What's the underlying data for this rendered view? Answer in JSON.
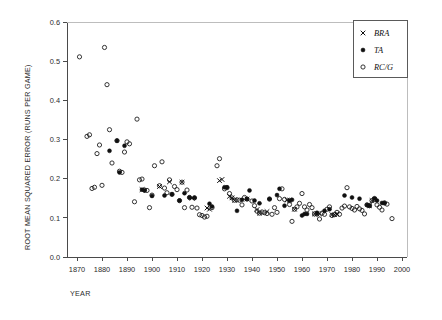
{
  "chart_data": {
    "type": "scatter",
    "title": "",
    "xlabel": "YEAR",
    "ylabel": "ROOT MEAN SQUARED ERROR (RUNS PER GAME)",
    "xlim": [
      1866,
      2002
    ],
    "ylim": [
      0.0,
      0.6
    ],
    "xticks": [
      1870,
      1880,
      1890,
      1900,
      1910,
      1920,
      1930,
      1940,
      1950,
      1960,
      1970,
      1980,
      1990,
      2000
    ],
    "yticks": [
      "0.0",
      "0.1",
      "0.2",
      "0.3",
      "0.4",
      "0.5",
      "0.6"
    ],
    "ytick_values": [
      0.0,
      0.1,
      0.2,
      0.3,
      0.4,
      0.5,
      0.6
    ],
    "grid": false,
    "legend_position": "top-right",
    "legend": [
      {
        "name": "BRA",
        "marker": "cross"
      },
      {
        "name": "TA",
        "marker": "filled-circle"
      },
      {
        "name": "RC/G",
        "marker": "open-circle"
      }
    ],
    "series": [
      {
        "name": "RC/G",
        "marker": "open-circle",
        "points": [
          [
            1871,
            0.511
          ],
          [
            1874,
            0.308
          ],
          [
            1875,
            0.312
          ],
          [
            1876,
            0.175
          ],
          [
            1877,
            0.178
          ],
          [
            1878,
            0.264
          ],
          [
            1879,
            0.286
          ],
          [
            1880,
            0.183
          ],
          [
            1881,
            0.535
          ],
          [
            1882,
            0.44
          ],
          [
            1883,
            0.325
          ],
          [
            1884,
            0.24
          ],
          [
            1886,
            0.297
          ],
          [
            1887,
            0.219
          ],
          [
            1888,
            0.216
          ],
          [
            1889,
            0.268
          ],
          [
            1890,
            0.294
          ],
          [
            1891,
            0.289
          ],
          [
            1893,
            0.141
          ],
          [
            1894,
            0.352
          ],
          [
            1895,
            0.197
          ],
          [
            1896,
            0.199
          ],
          [
            1897,
            0.171
          ],
          [
            1898,
            0.17
          ],
          [
            1899,
            0.126
          ],
          [
            1900,
            0.158
          ],
          [
            1901,
            0.233
          ],
          [
            1903,
            0.182
          ],
          [
            1904,
            0.243
          ],
          [
            1905,
            0.176
          ],
          [
            1906,
            0.164
          ],
          [
            1907,
            0.197
          ],
          [
            1908,
            0.16
          ],
          [
            1909,
            0.18
          ],
          [
            1910,
            0.172
          ],
          [
            1911,
            0.144
          ],
          [
            1912,
            0.191
          ],
          [
            1913,
            0.126
          ],
          [
            1914,
            0.171
          ],
          [
            1915,
            0.152
          ],
          [
            1916,
            0.127
          ],
          [
            1917,
            0.151
          ],
          [
            1918,
            0.125
          ],
          [
            1919,
            0.108
          ],
          [
            1920,
            0.106
          ],
          [
            1921,
            0.102
          ],
          [
            1922,
            0.104
          ],
          [
            1924,
            0.126
          ],
          [
            1926,
            0.233
          ],
          [
            1927,
            0.251
          ],
          [
            1929,
            0.174
          ],
          [
            1930,
            0.177
          ],
          [
            1931,
            0.162
          ],
          [
            1932,
            0.151
          ],
          [
            1933,
            0.145
          ],
          [
            1934,
            0.146
          ],
          [
            1935,
            0.145
          ],
          [
            1936,
            0.133
          ],
          [
            1937,
            0.152
          ],
          [
            1938,
            0.148
          ],
          [
            1940,
            0.143
          ],
          [
            1941,
            0.131
          ],
          [
            1942,
            0.117
          ],
          [
            1943,
            0.112
          ],
          [
            1944,
            0.115
          ],
          [
            1945,
            0.113
          ],
          [
            1946,
            0.111
          ],
          [
            1947,
            0.148
          ],
          [
            1948,
            0.109
          ],
          [
            1949,
            0.126
          ],
          [
            1950,
            0.114
          ],
          [
            1951,
            0.149
          ],
          [
            1952,
            0.174
          ],
          [
            1953,
            0.147
          ],
          [
            1955,
            0.134
          ],
          [
            1956,
            0.091
          ],
          [
            1957,
            0.122
          ],
          [
            1958,
            0.128
          ],
          [
            1959,
            0.137
          ],
          [
            1960,
            0.162
          ],
          [
            1961,
            0.128
          ],
          [
            1962,
            0.12
          ],
          [
            1963,
            0.134
          ],
          [
            1964,
            0.126
          ],
          [
            1965,
            0.11
          ],
          [
            1966,
            0.11
          ],
          [
            1967,
            0.097
          ],
          [
            1968,
            0.112
          ],
          [
            1969,
            0.109
          ],
          [
            1970,
            0.122
          ],
          [
            1971,
            0.128
          ],
          [
            1972,
            0.106
          ],
          [
            1973,
            0.108
          ],
          [
            1974,
            0.114
          ],
          [
            1975,
            0.109
          ],
          [
            1976,
            0.125
          ],
          [
            1977,
            0.13
          ],
          [
            1978,
            0.177
          ],
          [
            1979,
            0.128
          ],
          [
            1980,
            0.124
          ],
          [
            1981,
            0.12
          ],
          [
            1982,
            0.129
          ],
          [
            1983,
            0.123
          ],
          [
            1984,
            0.119
          ],
          [
            1985,
            0.11
          ],
          [
            1986,
            0.133
          ],
          [
            1987,
            0.131
          ],
          [
            1988,
            0.144
          ],
          [
            1989,
            0.147
          ],
          [
            1990,
            0.133
          ],
          [
            1991,
            0.127
          ],
          [
            1992,
            0.12
          ],
          [
            1993,
            0.138
          ],
          [
            1994,
            0.135
          ],
          [
            1996,
            0.098
          ]
        ]
      },
      {
        "name": "TA",
        "marker": "filled-circle",
        "points": [
          [
            1883,
            0.271
          ],
          [
            1886,
            0.297
          ],
          [
            1887,
            0.216
          ],
          [
            1889,
            0.284
          ],
          [
            1896,
            0.172
          ],
          [
            1897,
            0.17
          ],
          [
            1900,
            0.156
          ],
          [
            1905,
            0.157
          ],
          [
            1908,
            0.16
          ],
          [
            1911,
            0.144
          ],
          [
            1913,
            0.163
          ],
          [
            1915,
            0.152
          ],
          [
            1917,
            0.151
          ],
          [
            1923,
            0.136
          ],
          [
            1924,
            0.129
          ],
          [
            1929,
            0.178
          ],
          [
            1930,
            0.178
          ],
          [
            1934,
            0.118
          ],
          [
            1936,
            0.146
          ],
          [
            1938,
            0.148
          ],
          [
            1939,
            0.17
          ],
          [
            1941,
            0.144
          ],
          [
            1943,
            0.137
          ],
          [
            1947,
            0.148
          ],
          [
            1950,
            0.158
          ],
          [
            1951,
            0.174
          ],
          [
            1953,
            0.131
          ],
          [
            1955,
            0.144
          ],
          [
            1956,
            0.146
          ],
          [
            1960,
            0.106
          ],
          [
            1961,
            0.11
          ],
          [
            1962,
            0.11
          ],
          [
            1966,
            0.113
          ],
          [
            1969,
            0.118
          ],
          [
            1971,
            0.122
          ],
          [
            1977,
            0.157
          ],
          [
            1980,
            0.152
          ],
          [
            1983,
            0.149
          ],
          [
            1986,
            0.133
          ],
          [
            1987,
            0.131
          ],
          [
            1989,
            0.15
          ],
          [
            1990,
            0.144
          ],
          [
            1992,
            0.138
          ],
          [
            1993,
            0.138
          ]
        ]
      },
      {
        "name": "BRA",
        "marker": "cross",
        "points": [
          [
            1896,
            0.172
          ],
          [
            1903,
            0.18
          ],
          [
            1907,
            0.192
          ],
          [
            1912,
            0.191
          ],
          [
            1916,
            0.15
          ],
          [
            1922,
            0.125
          ],
          [
            1923,
            0.122
          ],
          [
            1927,
            0.195
          ],
          [
            1928,
            0.198
          ],
          [
            1931,
            0.155
          ],
          [
            1932,
            0.151
          ],
          [
            1933,
            0.145
          ],
          [
            1938,
            0.148
          ],
          [
            1942,
            0.121
          ],
          [
            1943,
            0.112
          ],
          [
            1946,
            0.116
          ],
          [
            1954,
            0.145
          ],
          [
            1955,
            0.145
          ],
          [
            1957,
            0.122
          ],
          [
            1965,
            0.11
          ],
          [
            1966,
            0.11
          ],
          [
            1967,
            0.11
          ],
          [
            1972,
            0.108
          ],
          [
            1973,
            0.108
          ],
          [
            1974,
            0.11
          ],
          [
            1987,
            0.131
          ],
          [
            1988,
            0.144
          ],
          [
            1989,
            0.147
          ]
        ]
      }
    ]
  }
}
